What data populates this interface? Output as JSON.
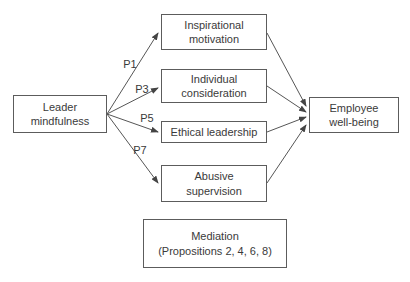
{
  "figure": {
    "nodes": {
      "leader_mindfulness": "Leader\nmindfulness",
      "inspirational_motivation": "Inspirational\nmotivation",
      "individual_consideration": "Individual\nconsideration",
      "ethical_leadership": "Ethical leadership",
      "abusive_supervision": "Abusive\nsupervision",
      "employee_wellbeing": "Employee\nwell-being",
      "mediation": "Mediation\n(Propositions 2, 4, 6, 8)"
    },
    "path_labels": {
      "p1": "P1",
      "p3": "P3",
      "p5": "P5",
      "p7": "P7"
    },
    "colors": {
      "line": "#565656",
      "border": "#5c5c5c",
      "text": "#3a3a3a",
      "background": "#ffffff"
    }
  }
}
